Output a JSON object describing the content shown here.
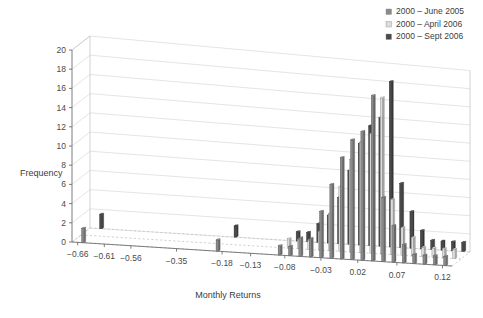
{
  "chart_data": {
    "type": "bar",
    "title": "",
    "subtitle": "",
    "xlabel": "Monthly Returns",
    "ylabel": "Frequency",
    "ylim": [
      0,
      20
    ],
    "ytick_step": 2,
    "yticks": [
      "0",
      "2",
      "4",
      "6",
      "8",
      "10",
      "12",
      "14",
      "16",
      "18",
      "20"
    ],
    "xticks": [
      "-0.66",
      "-0.61",
      "-0.56",
      "-0.35",
      "-0.18",
      "-0.13",
      "-0.08",
      "-0.03",
      "0.02",
      "0.07",
      "0.12"
    ],
    "grid": true,
    "grid_axis": "y",
    "projection": "3d",
    "legend_position": "top-right",
    "legend": [
      {
        "label": "2000 – June 2005",
        "color": "#8a8a8a"
      },
      {
        "label": "2000 – April 2006",
        "color": "#dcdcdc"
      },
      {
        "label": "2000 – Sept 2006",
        "color": "#4a4a4a"
      }
    ],
    "series": [
      {
        "name": "2000 – June 2005",
        "color": "#8a8a8a",
        "values": [
          1.5,
          0,
          0,
          0,
          0,
          0,
          1,
          0,
          0,
          0,
          0,
          0,
          0,
          0,
          0,
          0,
          0,
          0,
          0,
          0,
          0,
          0,
          1,
          1,
          1,
          2,
          3,
          5,
          8,
          11,
          13,
          14,
          18,
          7,
          3,
          2,
          1,
          0,
          1,
          0,
          0,
          1
        ]
      },
      {
        "name": "2000 – April 2006",
        "color": "#dcdcdc",
        "values": [
          0,
          0,
          0,
          0,
          0,
          0,
          0,
          0,
          0,
          0,
          0,
          0,
          0,
          0,
          0,
          0,
          0,
          0,
          0,
          0,
          0,
          0,
          1,
          1,
          1,
          2,
          3,
          5,
          8,
          11,
          13,
          14,
          18,
          7,
          4,
          2,
          1,
          0,
          1,
          0,
          0,
          1
        ]
      },
      {
        "name": "2000 – Sept 2006",
        "color": "#4a4a4a",
        "values": [
          1.5,
          0,
          0,
          0,
          0,
          0,
          1,
          0,
          0,
          0,
          0,
          0,
          0,
          0,
          0,
          0,
          0,
          0,
          0,
          0,
          0,
          0,
          1,
          1,
          2,
          2,
          3,
          5,
          8,
          11,
          13,
          14,
          18,
          7,
          4,
          2,
          1,
          0,
          1,
          0,
          0,
          1
        ]
      }
    ],
    "bins": [
      {
        "x": "-0.66",
        "groups": [
          1.5,
          0,
          1.5
        ]
      },
      {
        "x": "-0.62",
        "groups": [
          0,
          0,
          0
        ]
      },
      {
        "x": "-0.58",
        "groups": [
          0,
          0,
          0
        ]
      },
      {
        "x": "-0.54",
        "groups": [
          0,
          0,
          0
        ]
      },
      {
        "x": "-0.50",
        "groups": [
          0,
          0,
          0
        ]
      },
      {
        "x": "-0.46",
        "groups": [
          0,
          0,
          0
        ]
      },
      {
        "x": "-0.42",
        "groups": [
          0,
          0,
          0
        ]
      },
      {
        "x": "-0.38",
        "groups": [
          0,
          0,
          0
        ]
      },
      {
        "x": "-0.34",
        "groups": [
          0,
          0,
          0
        ]
      },
      {
        "x": "-0.30",
        "groups": [
          0,
          0,
          0
        ]
      },
      {
        "x": "-0.26",
        "groups": [
          0,
          0,
          0
        ]
      },
      {
        "x": "-0.22",
        "groups": [
          0,
          0,
          0
        ]
      },
      {
        "x": "-0.18",
        "groups": [
          0,
          0,
          0
        ]
      },
      {
        "x": "-0.16",
        "groups": [
          1.2,
          0,
          1.2
        ]
      },
      {
        "x": "-0.14",
        "groups": [
          0,
          0,
          0
        ]
      },
      {
        "x": "-0.12",
        "groups": [
          0,
          0,
          0
        ]
      },
      {
        "x": "-0.10",
        "groups": [
          0,
          0,
          0
        ]
      },
      {
        "x": "-0.08",
        "groups": [
          0,
          0,
          0
        ]
      },
      {
        "x": "-0.06",
        "groups": [
          0,
          0,
          0
        ]
      },
      {
        "x": "-0.045",
        "groups": [
          1,
          1,
          1
        ]
      },
      {
        "x": "-0.035",
        "groups": [
          1,
          1,
          1
        ]
      },
      {
        "x": "-0.025",
        "groups": [
          2,
          1,
          2
        ]
      },
      {
        "x": "-0.015",
        "groups": [
          2,
          2,
          3
        ]
      },
      {
        "x": "-0.005",
        "groups": [
          5,
          4,
          5
        ]
      },
      {
        "x": "0.005",
        "groups": [
          8,
          7,
          8
        ]
      },
      {
        "x": "0.012",
        "groups": [
          11,
          10,
          11
        ]
      },
      {
        "x": "0.018",
        "groups": [
          13,
          12,
          13
        ]
      },
      {
        "x": "0.024",
        "groups": [
          14,
          13,
          14
        ]
      },
      {
        "x": "0.030",
        "groups": [
          18,
          17,
          18
        ]
      },
      {
        "x": "0.038",
        "groups": [
          7,
          6,
          7
        ]
      },
      {
        "x": "0.046",
        "groups": [
          4,
          3,
          4
        ]
      },
      {
        "x": "0.055",
        "groups": [
          2,
          2,
          2
        ]
      },
      {
        "x": "0.065",
        "groups": [
          1,
          1,
          1
        ]
      },
      {
        "x": "0.080",
        "groups": [
          1,
          1,
          1
        ]
      },
      {
        "x": "0.095",
        "groups": [
          1,
          1,
          1
        ]
      },
      {
        "x": "0.120",
        "groups": [
          1,
          1,
          1
        ]
      }
    ]
  }
}
